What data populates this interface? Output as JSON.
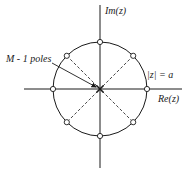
{
  "diagram": {
    "type": "pole-zero plot (z-plane)",
    "axes": {
      "imag_label": "Im(z)",
      "real_label": "Re(z)"
    },
    "circle": {
      "label": "|z| = a",
      "radius_label": "a"
    },
    "annotations": {
      "poles_label": "M - 1 poles"
    },
    "zeros": {
      "count": 8,
      "angles_deg": [
        0,
        45,
        90,
        135,
        180,
        225,
        270,
        315
      ],
      "on_circle": true
    },
    "poles": {
      "location": "origin",
      "multiplicity": "M - 1"
    },
    "colors": {
      "ink": "#1a1a1a",
      "background": "#ffffff"
    }
  }
}
